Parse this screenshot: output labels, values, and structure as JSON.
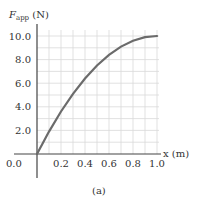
{
  "chart_data": {
    "type": "line",
    "title": "",
    "ylabel_main": "F",
    "ylabel_sub": "app",
    "ylabel_unit": " (N)",
    "xlabel": "x (m)",
    "caption": "(a)",
    "xlim": [
      0,
      1.0
    ],
    "ylim": [
      0,
      10.0
    ],
    "x_ticks": [
      "0.2",
      "0.4",
      "0.6",
      "0.8",
      "1.0"
    ],
    "x_tick_values": [
      0.2,
      0.4,
      0.6,
      0.8,
      1.0
    ],
    "y_ticks": [
      "2.0",
      "4.0",
      "6.0",
      "8.0",
      "10.0"
    ],
    "y_tick_values": [
      2,
      4,
      6,
      8,
      10
    ],
    "origin_label": "0.0",
    "grid": true,
    "grid_minor_x_step": 0.1,
    "grid_minor_y_step": 1.0,
    "series": [
      {
        "name": "F_app vs x",
        "x": [
          0.0,
          0.1,
          0.2,
          0.3,
          0.4,
          0.5,
          0.6,
          0.7,
          0.8,
          0.9,
          1.0
        ],
        "y": [
          0.0,
          1.9,
          3.6,
          5.1,
          6.4,
          7.5,
          8.4,
          9.1,
          9.6,
          9.9,
          10.0
        ]
      }
    ],
    "colors": {
      "curve": "#6b6b6b",
      "axis": "#444444",
      "grid": "#d9d9d9"
    }
  }
}
